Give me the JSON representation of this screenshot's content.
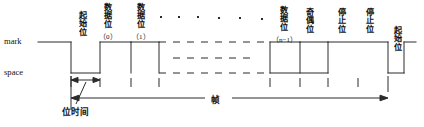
{
  "figure": {
    "title": "",
    "type": "uart-serial-frame-timing-diagram",
    "levels": {
      "mark_label": "mark",
      "space_label": "space"
    },
    "bit_labels": [
      {
        "name": "start-bit",
        "text": "起始位",
        "sub": ""
      },
      {
        "name": "data-bit-0",
        "text": "数据位",
        "sub": "（0）"
      },
      {
        "name": "data-bit-1",
        "text": "数据位",
        "sub": "（1）"
      },
      {
        "name": "data-bit-n-1",
        "text": "数据位",
        "sub": "（n−1）"
      },
      {
        "name": "parity-bit",
        "text": "奇偶位",
        "sub": ""
      },
      {
        "name": "stop-bit-1",
        "text": "停止位",
        "sub": ""
      },
      {
        "name": "stop-bit-2",
        "text": "停止位",
        "sub": ""
      },
      {
        "name": "next-start-bit",
        "text": "起始位",
        "sub": ""
      }
    ],
    "ellipsis_dots": 6,
    "dimensions": {
      "bit_time_label": "位时间",
      "frame_label": "帧"
    },
    "colors": {
      "line": "#2b2b2b",
      "background": "#ffffff",
      "text": "#111111"
    }
  }
}
